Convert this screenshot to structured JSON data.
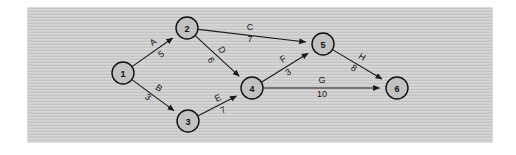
{
  "figure": {
    "kind": "activity-network-diagram",
    "panel": {
      "background_color": "#c9c9c9",
      "page_color": "#ffffff"
    }
  },
  "chart_data": {
    "type": "diagram",
    "title": "",
    "subtitle": "",
    "xlabel": "",
    "ylabel": "",
    "layout": "directed acyclic graph, left-to-right, node-on-node (AON) style with labelled weighted arcs",
    "node_shape": "circle",
    "node_fill": "#c2c2c2",
    "node_stroke": "#111111",
    "edge_color": "#1a1a1a",
    "nodes": [
      {
        "id": "1",
        "label": "1",
        "x": 123,
        "y": 73,
        "r": 11
      },
      {
        "id": "2",
        "label": "2",
        "x": 187,
        "y": 28,
        "r": 11
      },
      {
        "id": "3",
        "label": "3",
        "x": 188,
        "y": 121,
        "r": 11
      },
      {
        "id": "4",
        "label": "4",
        "x": 252,
        "y": 88,
        "r": 11
      },
      {
        "id": "5",
        "label": "5",
        "x": 323,
        "y": 44,
        "r": 11
      },
      {
        "id": "6",
        "label": "6",
        "x": 397,
        "y": 88,
        "r": 11
      }
    ],
    "edges": [
      {
        "name": "A",
        "weight": "5",
        "from": "1",
        "to": "2",
        "name_x": 153,
        "name_y": 42,
        "name_rot": -35,
        "weight_x": 161,
        "weight_y": 54,
        "weight_rot": -35
      },
      {
        "name": "B",
        "weight": "3",
        "from": "1",
        "to": "3",
        "name_x": 159,
        "name_y": 88,
        "name_rot": 35,
        "weight_x": 148,
        "weight_y": 97,
        "weight_rot": 35
      },
      {
        "name": "C",
        "weight": "7",
        "from": "2",
        "to": "5",
        "name_x": 250,
        "name_y": 27,
        "name_rot": 0,
        "weight_x": 250,
        "weight_y": 39,
        "weight_rot": 0
      },
      {
        "name": "D",
        "weight": "6",
        "from": "2",
        "to": "4",
        "name_x": 222,
        "name_y": 50,
        "name_rot": 62,
        "weight_x": 211,
        "weight_y": 60,
        "weight_rot": 62
      },
      {
        "name": "E",
        "weight": "7",
        "from": "3",
        "to": "4",
        "name_x": 218,
        "name_y": 98,
        "name_rot": -26,
        "weight_x": 223,
        "weight_y": 110,
        "weight_rot": -26
      },
      {
        "name": "F",
        "weight": "3",
        "from": "4",
        "to": "5",
        "name_x": 283,
        "name_y": 59,
        "name_rot": -32,
        "weight_x": 288,
        "weight_y": 72,
        "weight_rot": -32
      },
      {
        "name": "G",
        "weight": "10",
        "from": "4",
        "to": "6",
        "name_x": 322,
        "name_y": 80,
        "name_rot": 0,
        "weight_x": 322,
        "weight_y": 94,
        "weight_rot": 0
      },
      {
        "name": "H",
        "weight": "8",
        "from": "5",
        "to": "6",
        "name_x": 362,
        "name_y": 57,
        "name_rot": 32,
        "weight_x": 354,
        "weight_y": 68,
        "weight_rot": 32
      }
    ]
  }
}
